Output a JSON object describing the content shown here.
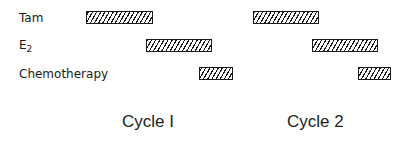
{
  "rows": [
    {
      "label": "Tam",
      "sub": ""
    },
    {
      "label": "E",
      "sub": "2"
    },
    {
      "label": "Chemotherapy",
      "sub": ""
    }
  ],
  "cycles": [
    {
      "label": "Cycle I"
    },
    {
      "label": "Cycle 2"
    }
  ],
  "bars": [
    {
      "row": "Tam",
      "cycle": 1,
      "x": 86,
      "y": 11,
      "w": 67
    },
    {
      "row": "E2",
      "cycle": 1,
      "x": 146,
      "y": 39,
      "w": 66
    },
    {
      "row": "Chemotherapy",
      "cycle": 1,
      "x": 199,
      "y": 67,
      "w": 34
    },
    {
      "row": "Tam",
      "cycle": 2,
      "x": 253,
      "y": 11,
      "w": 66
    },
    {
      "row": "E2",
      "cycle": 2,
      "x": 312,
      "y": 39,
      "w": 66
    },
    {
      "row": "Chemotherapy",
      "cycle": 2,
      "x": 358,
      "y": 67,
      "w": 33
    }
  ],
  "colors": {
    "ink": "#1a1a1a",
    "background": "#ffffff"
  }
}
